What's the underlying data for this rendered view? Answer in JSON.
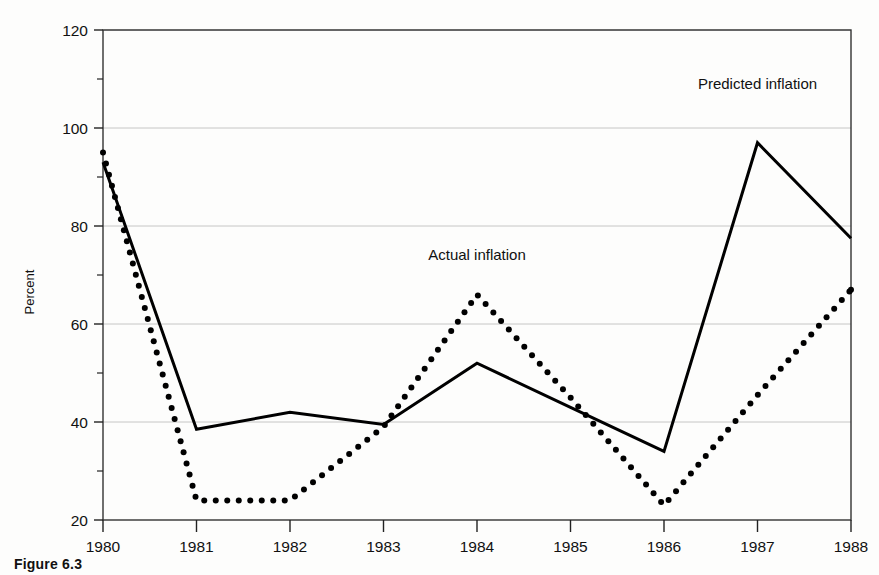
{
  "figure": {
    "caption_label": "Figure",
    "caption_number": "6.3"
  },
  "chart_data": {
    "type": "line",
    "title": "",
    "xlabel": "",
    "ylabel": "Percent",
    "x": [
      1980,
      1981,
      1982,
      1983,
      1984,
      1985,
      1986,
      1987,
      1988
    ],
    "xtick_labels": [
      "1980",
      "1981",
      "1982",
      "1983",
      "1984",
      "1985",
      "1986",
      "1987",
      "1988"
    ],
    "ytick_labels": [
      "20",
      "40",
      "60",
      "80",
      "100",
      "120"
    ],
    "yticks": [
      20,
      40,
      60,
      80,
      100,
      120
    ],
    "yminor": [
      30,
      50,
      70,
      90,
      110
    ],
    "ylim": [
      20,
      120
    ],
    "xlim": [
      1980,
      1988
    ],
    "grid": "horizontal",
    "legend": "inline-annotations",
    "series": [
      {
        "name": "Predicted inflation",
        "style": "solid",
        "color": "#000000",
        "values": [
          93,
          38.5,
          42,
          39.5,
          52,
          43,
          34,
          97,
          77.5
        ],
        "annotation": {
          "text": "Predicted inflation",
          "x": 1987,
          "y": 108
        }
      },
      {
        "name": "Actual inflation",
        "style": "dotted",
        "color": "#000000",
        "values": [
          95,
          24,
          24,
          39,
          66,
          45,
          23,
          45.5,
          67
        ],
        "annotation": {
          "text": "Actual inflation",
          "x": 1984,
          "y": 73
        }
      }
    ]
  }
}
